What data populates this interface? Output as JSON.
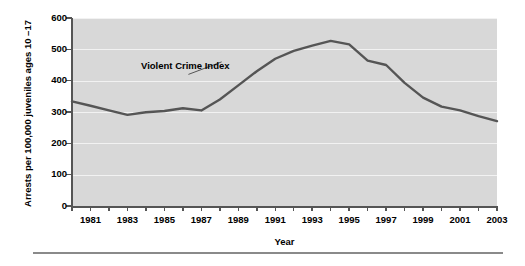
{
  "chart_data": {
    "type": "line",
    "title": "",
    "xlabel": "Year",
    "ylabel": "Arrests per 100,000 juveniles ages 10 –17",
    "xlim": [
      1980,
      2003
    ],
    "ylim": [
      0,
      600
    ],
    "grid": true,
    "legend_position": "inline-annotation",
    "annotations": [
      {
        "text": "Violent Crime Index",
        "x": 1985,
        "y": 440
      }
    ],
    "y_ticks": [
      0,
      100,
      200,
      300,
      400,
      500,
      600
    ],
    "y_tick_labels": [
      "0",
      "100",
      "200",
      "300",
      "400",
      "500",
      "600"
    ],
    "x_ticks": [
      1980,
      1981,
      1982,
      1983,
      1984,
      1985,
      1986,
      1987,
      1988,
      1989,
      1990,
      1991,
      1992,
      1993,
      1994,
      1995,
      1996,
      1997,
      1998,
      1999,
      2000,
      2001,
      2002,
      2003
    ],
    "x_tick_labels": [
      "",
      "1981",
      "",
      "1983",
      "",
      "1985",
      "",
      "1987",
      "",
      "1989",
      "",
      "1991",
      "",
      "1993",
      "",
      "1995",
      "",
      "1997",
      "",
      "1999",
      "",
      "2001",
      "",
      "2003"
    ],
    "series": [
      {
        "name": "Violent Crime Index",
        "color": "#555555",
        "x": [
          1980,
          1981,
          1982,
          1983,
          1984,
          1985,
          1986,
          1987,
          1988,
          1989,
          1990,
          1991,
          1992,
          1993,
          1994,
          1995,
          1996,
          1997,
          1998,
          1999,
          2000,
          2001,
          2002,
          2003
        ],
        "values": [
          334,
          320,
          305,
          291,
          299,
          303,
          312,
          305,
          340,
          385,
          430,
          470,
          495,
          512,
          527,
          516,
          464,
          450,
          393,
          346,
          317,
          305,
          287,
          271
        ]
      }
    ]
  },
  "axis": {
    "y_title": "Arrests per 100,000 juveniles ages 10 –17",
    "x_title": "Year"
  },
  "colors": {
    "plot_background": "#d8d8d8",
    "gridline": "#f2f2f2",
    "series_line": "#555555",
    "axis": "#555555",
    "rule": "#8a8a8a",
    "text": "#000000"
  }
}
